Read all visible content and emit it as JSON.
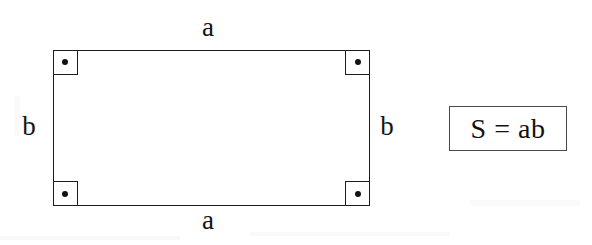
{
  "figure": {
    "type": "geometry-diagram",
    "shape": "rectangle",
    "background_color": "#ffffff",
    "stroke_color": "#1c1c1c",
    "labels": {
      "top_side": "a",
      "bottom_side": "a",
      "left_side": "b",
      "right_side": "b"
    },
    "right_angle_markers": {
      "count": 4,
      "glyph": "right-angle-square-with-dot",
      "positions": [
        "top-left",
        "top-right",
        "bottom-left",
        "bottom-right"
      ]
    },
    "formula": {
      "text": "S = ab",
      "border_color": "#4a4a4a"
    }
  }
}
